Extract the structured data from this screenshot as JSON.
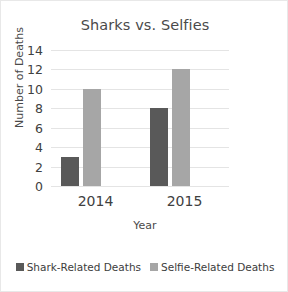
{
  "chart_data": {
    "type": "bar",
    "title": "Sharks vs. Selfies",
    "xlabel": "Year",
    "ylabel": "Number of Deaths",
    "categories": [
      "2014",
      "2015"
    ],
    "series": [
      {
        "name": "Shark-Related Deaths",
        "values": [
          3,
          8
        ],
        "color": "#595959"
      },
      {
        "name": "Selfie-Related Deaths",
        "values": [
          10,
          12
        ],
        "color": "#a6a6a6"
      }
    ],
    "ylim": [
      0,
      14
    ],
    "yticks": [
      "0",
      "2",
      "4",
      "6",
      "8",
      "10",
      "12",
      "14"
    ],
    "grid": true,
    "legend_position": "bottom"
  },
  "legend": {
    "entries": [
      {
        "label": "Shark-Related Deaths"
      },
      {
        "label": "Selfie-Related Deaths"
      }
    ]
  }
}
